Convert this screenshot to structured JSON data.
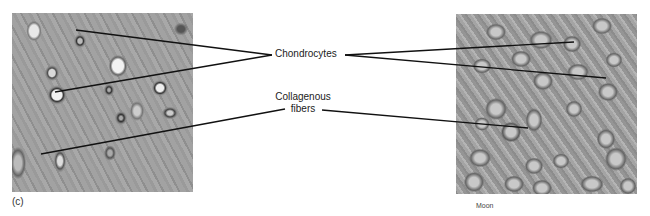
{
  "figure": {
    "panel_label": "(c)",
    "credit": "Moon",
    "labels": {
      "chondrocytes": "Chondrocytes",
      "collagenous_line1": "Collagenous",
      "collagenous_line2": "fibers"
    },
    "images": [
      {
        "name": "hyaline-cartilage-micrograph-left",
        "description": "light micrograph, gray tones"
      },
      {
        "name": "cartilage-micrograph-right",
        "description": "light micrograph, gray tones"
      }
    ],
    "leader_lines": [
      {
        "label": "Chondrocytes",
        "from": [
          272,
          55
        ],
        "to": [
          76,
          30
        ]
      },
      {
        "label": "Chondrocytes",
        "from": [
          272,
          55
        ],
        "to": [
          55,
          92
        ]
      },
      {
        "label": "Chondrocytes",
        "from": [
          345,
          55
        ],
        "to": [
          574,
          42
        ]
      },
      {
        "label": "Chondrocytes",
        "from": [
          345,
          55
        ],
        "to": [
          606,
          78
        ]
      },
      {
        "label": "Collagenous fibers",
        "from": [
          285,
          109
        ],
        "to": [
          41,
          154
        ]
      },
      {
        "label": "Collagenous fibers",
        "from": [
          322,
          110
        ],
        "to": [
          528,
          128
        ]
      }
    ],
    "line_color": "#111111"
  }
}
